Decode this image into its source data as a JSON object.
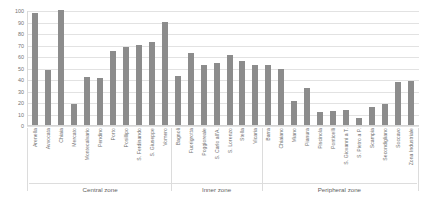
{
  "chart_data": {
    "type": "bar",
    "title": "",
    "xlabel": "",
    "ylabel": "",
    "ylim": [
      0,
      100
    ],
    "yticks": [
      100,
      90,
      80,
      70,
      60,
      50,
      40,
      30,
      20,
      10,
      0
    ],
    "grid": true,
    "legend": "none",
    "bar_color": "#8c8c8c",
    "categories": [
      "Arenella",
      "Avvocata",
      "Chiaia",
      "Mercato",
      "Montecalvario",
      "Pendino",
      "Porto",
      "Posillipo",
      "S. Ferdinando",
      "S. Giuseppe",
      "Vomero",
      "Bagnoli",
      "Fuorigrotta",
      "Poggioreale",
      "S. Carlo all'A.",
      "S. Lorenzo",
      "Stella",
      "Vicaria",
      "Barra",
      "Chiaiano",
      "Miano",
      "Pianura",
      "Piscinola",
      "Ponticelli",
      "S. Giovanni a T.",
      "S. Pietro a P.",
      "Scampia",
      "Secondigliano",
      "Soccavo",
      "Zona Industriale"
    ],
    "values": [
      97,
      48,
      100,
      18,
      42,
      41,
      64,
      68,
      70,
      72,
      90,
      43,
      63,
      52,
      54,
      61,
      56,
      52,
      52,
      49,
      21,
      32,
      11,
      12,
      13,
      6,
      16,
      18,
      37,
      38
    ],
    "groups": [
      {
        "label": "Central zone",
        "start": 0,
        "end": 10
      },
      {
        "label": "Inner zone",
        "start": 11,
        "end": 17
      },
      {
        "label": "Peripheral zone",
        "start": 18,
        "end": 29
      }
    ]
  }
}
